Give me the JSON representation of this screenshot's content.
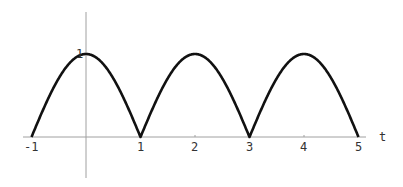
{
  "chart_data": {
    "type": "line",
    "title": "",
    "xlabel": "t",
    "ylabel": "",
    "function": "|cos(pi t / 2)|",
    "xlim": [
      -1,
      5
    ],
    "ylim": [
      0,
      1
    ],
    "x_ticks": [
      "-1",
      "1",
      "2",
      "3",
      "4",
      "5"
    ],
    "y_ticks": [
      "1"
    ],
    "grid": false,
    "legend": null,
    "series": [
      {
        "name": "curve",
        "x": [
          -1,
          -0.5,
          0,
          0.5,
          1,
          1.5,
          2,
          2.5,
          3,
          3.5,
          4,
          4.5,
          5
        ],
        "y": [
          0,
          0.707,
          1,
          0.707,
          0,
          0.707,
          1,
          0.707,
          0,
          0.707,
          1,
          0.707,
          0
        ]
      }
    ]
  },
  "axes": {
    "x_label": "t",
    "tick_x": [
      "-1",
      "1",
      "2",
      "3",
      "4",
      "5"
    ],
    "tick_y": "1"
  },
  "colors": {
    "curve": "#111111",
    "axis": "#999999"
  }
}
